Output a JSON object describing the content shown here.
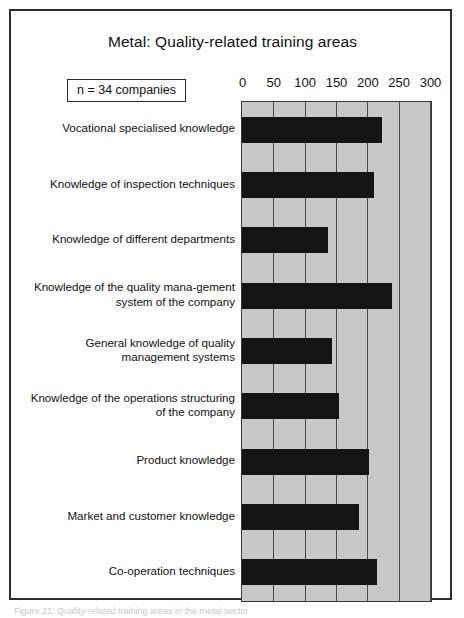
{
  "figure": {
    "title": "Metal: Quality-related training areas",
    "sample_note": "n = 34 companies",
    "caption": "Figure 21: Quality-related training areas in the metal sector"
  },
  "chart_data": {
    "type": "bar",
    "orientation": "horizontal",
    "title": "Metal: Quality-related training areas",
    "xlabel": "",
    "ylabel": "",
    "xlim": [
      0,
      300
    ],
    "xticks": [
      0,
      50,
      100,
      150,
      200,
      250,
      300
    ],
    "xtick_labels": [
      "0",
      "50",
      "100",
      "150",
      "200",
      "250",
      "300"
    ],
    "grid": true,
    "legend": false,
    "plot_background": "#c8c8c8",
    "bar_color": "#141414",
    "annotation": "n = 34 companies",
    "categories": [
      "Vocational specialised knowledge",
      "Knowledge of inspection techniques",
      "Knowledge of different departments",
      "Knowledge of the quality mana-gement system of the company",
      "General knowledge of quality management systems",
      "Knowledge of the operations structuring of the company",
      "Product knowledge",
      "Market and customer knowledge",
      "Co-operation techniques"
    ],
    "values": [
      224,
      210,
      137,
      240,
      143,
      155,
      202,
      186,
      216
    ]
  }
}
